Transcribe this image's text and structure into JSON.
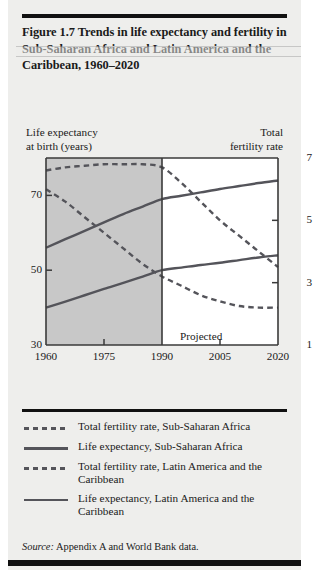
{
  "figure": {
    "title": "Figure 1.7  Trends in life expectancy and fertility in Sub-Saharan Africa and Latin America and the Caribbean, 1960–2020",
    "source_label": "Source:",
    "source_text": "Appendix A and World Bank data."
  },
  "axis": {
    "left_label_line1": "Life expectancy",
    "left_label_line2": "at birth (years)",
    "right_label_line1": "Total",
    "right_label_line2": "fertility rate"
  },
  "annotations": {
    "projected": "Projected"
  },
  "legend": {
    "items": [
      {
        "style": "dashed",
        "label": "Total fertility rate, Sub-Saharan Africa"
      },
      {
        "style": "solid",
        "label": "Life expectancy, Sub-Saharan Africa"
      },
      {
        "style": "dashed",
        "label": "Total fertility rate, Latin America and the Caribbean"
      },
      {
        "style": "solid",
        "label": "Life expectancy, Latin America and the Caribbean"
      }
    ]
  },
  "colors": {
    "page_background": "#eeeeec",
    "shaded_region": "#c8c8c8",
    "projected_region": "#ffffff",
    "line": "#54545a",
    "axis": "#3a3a3a",
    "text": "#1a1a1a",
    "rule": "#111111"
  },
  "chart_data": {
    "type": "line",
    "title": "Trends in life expectancy and fertility in Sub-Saharan Africa and Latin America and the Caribbean, 1960–2020",
    "xlabel": "",
    "ylabel": "Life expectancy at birth (years)",
    "y2label": "Total fertility rate",
    "xlim": [
      1960,
      2020
    ],
    "ylim": [
      30,
      80
    ],
    "y2lim": [
      1,
      7
    ],
    "xticks": [
      1960,
      1975,
      1990,
      2005,
      2020
    ],
    "xticklabels": [
      "1960",
      "1975",
      "1990",
      "2005",
      "2020"
    ],
    "yticks": [
      30,
      50,
      70
    ],
    "yticklabels": [
      "30",
      "50",
      "70"
    ],
    "y2ticks": [
      1,
      3,
      5,
      7
    ],
    "y2ticklabels": [
      "1",
      "3",
      "5",
      "7"
    ],
    "grid": false,
    "legend_position": "below",
    "shaded_x_range": [
      1960,
      1990
    ],
    "projected_x_range": [
      1990,
      2020
    ],
    "projection_divider_x": 1990,
    "annotation": "Projected",
    "x": [
      1960,
      1965,
      1970,
      1975,
      1980,
      1985,
      1990,
      1995,
      2000,
      2005,
      2010,
      2015,
      2020
    ],
    "series": [
      {
        "name": "Total fertility rate, Sub-Saharan Africa",
        "axis": "right",
        "style": "dashed",
        "values": [
          6.6,
          6.7,
          6.75,
          6.8,
          6.8,
          6.8,
          6.7,
          6.2,
          5.6,
          5.0,
          4.5,
          4.0,
          3.5
        ]
      },
      {
        "name": "Life expectancy, Sub-Saharan Africa",
        "axis": "left",
        "style": "solid",
        "values": [
          40.0,
          41.6,
          43.3,
          45.0,
          46.6,
          48.3,
          50.0,
          50.7,
          51.4,
          52.0,
          52.7,
          53.4,
          54.0
        ]
      },
      {
        "name": "Total fertility rate, Latin America and the Caribbean",
        "axis": "right",
        "style": "dashed",
        "values": [
          6.0,
          5.6,
          5.1,
          4.6,
          4.1,
          3.6,
          3.2,
          2.9,
          2.6,
          2.4,
          2.25,
          2.2,
          2.2
        ]
      },
      {
        "name": "Life expectancy, Latin America and the Caribbean",
        "axis": "left",
        "style": "solid",
        "values": [
          56.0,
          58.3,
          60.5,
          62.8,
          65.0,
          67.0,
          69.0,
          69.9,
          70.8,
          71.7,
          72.5,
          73.3,
          74.0
        ]
      }
    ]
  }
}
